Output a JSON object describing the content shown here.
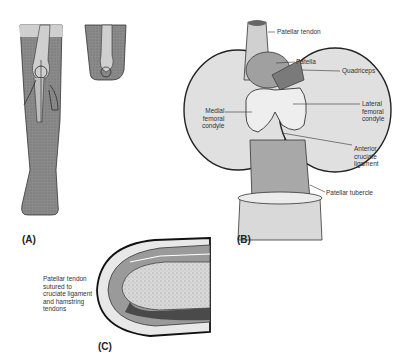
{
  "figure": {
    "panels": [
      {
        "id": "A",
        "label": "(A)"
      },
      {
        "id": "B",
        "label": "(B)"
      },
      {
        "id": "C",
        "label": "(C)"
      }
    ],
    "panel_b_labels": {
      "patellar_tendon": "Patellar tendon",
      "patella": "Patella",
      "quadriceps": "Quadriceps",
      "lateral_femoral_condyle": "Lateral\nfemoral\ncondyle",
      "medial_femoral_condyle": "Medial\nfemoral\ncondyle",
      "anterior_cruciate_ligament": "Anterior\ncruciate\nligament",
      "patellar_tubercle": "Patellar tubercle"
    },
    "panel_c_labels": {
      "sutured_note": "Patellar tendon\nsutured to\ncruciate ligament\nand hamstring\ntendons"
    }
  }
}
